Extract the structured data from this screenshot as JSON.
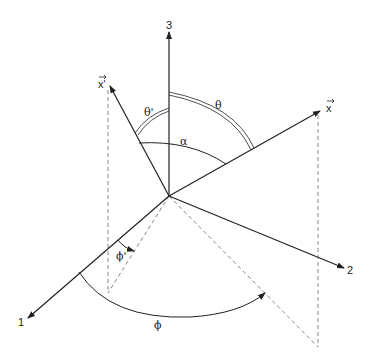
{
  "diagram": {
    "type": "3d-coordinate-system",
    "axes": [
      {
        "id": "axis-1",
        "label": "1"
      },
      {
        "id": "axis-2",
        "label": "2"
      },
      {
        "id": "axis-3",
        "label": "3"
      }
    ],
    "vectors": [
      {
        "id": "vector-x",
        "label": "x"
      },
      {
        "id": "vector-x-prime",
        "label": "x'"
      }
    ],
    "angles": {
      "theta": "θ",
      "theta_prime": "θ'",
      "alpha": "α",
      "phi": "ϕ",
      "phi_prime": "ϕ'"
    },
    "colors": {
      "line": "#222222",
      "dashed": "#888888",
      "background": "#ffffff"
    }
  }
}
